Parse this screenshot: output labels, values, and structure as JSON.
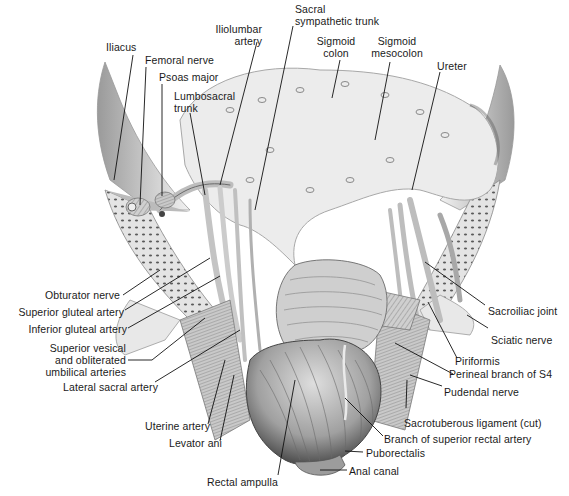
{
  "figure": {
    "colors": {
      "background": "#ffffff",
      "ink": "#1a1a1a",
      "tissue_light": "#e6e6e6",
      "tissue_mid": "#bdbdbd",
      "tissue_dark": "#6e6e6e"
    }
  },
  "labels": {
    "iliacus": "Iliacus",
    "femoral_nerve": "Femoral nerve",
    "psoas_major": "Psoas major",
    "lumbosacral_trunk_1": "Lumbosacral",
    "lumbosacral_trunk_2": "trunk",
    "iliolumbar_artery_1": "Iliolumbar",
    "iliolumbar_artery_2": "artery",
    "sacral_sympathetic_trunk_1": "Sacral",
    "sacral_sympathetic_trunk_2": "sympathetic trunk",
    "sigmoid_colon_1": "Sigmoid",
    "sigmoid_colon_2": "colon",
    "sigmoid_mesocolon_1": "Sigmoid",
    "sigmoid_mesocolon_2": "mesocolon",
    "ureter": "Ureter",
    "obturator_nerve": "Obturator nerve",
    "superior_gluteal_artery": "Superior gluteal artery",
    "inferior_gluteal_artery": "Inferior gluteal artery",
    "superior_vesical_1": "Superior vesical",
    "superior_vesical_2": "and obliterated",
    "superior_vesical_3": "umbilical arteries",
    "lateral_sacral_artery": "Lateral sacral artery",
    "uterine_artery": "Uterine artery",
    "levator_ani": "Levator ani",
    "rectal_ampulla": "Rectal ampulla",
    "sacroiliac_joint": "Sacroiliac joint",
    "sciatic_nerve": "Sciatic nerve",
    "piriformis": "Piriformis",
    "perineal_branch_s4": "Perineal branch of S4",
    "pudendal_nerve": "Pudendal nerve",
    "sacrotuberous_ligament": "Sacrotuberous ligament (cut)",
    "branch_superior_rectal_artery": "Branch of superior rectal artery",
    "puborectalis": "Puborectalis",
    "anal_canal": "Anal canal"
  }
}
